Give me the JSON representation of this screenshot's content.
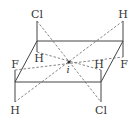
{
  "diagram": {
    "title": "",
    "center_label": "i",
    "atoms": [
      {
        "id": "cl_top",
        "label": "Cl",
        "x": 37,
        "y": 17
      },
      {
        "id": "h_top_right",
        "label": "H",
        "x": 123,
        "y": 17
      },
      {
        "id": "h_inner_left",
        "label": "H",
        "x": 38,
        "y": 60
      },
      {
        "id": "f_right",
        "label": "F",
        "x": 124,
        "y": 66
      },
      {
        "id": "f_left",
        "label": "F",
        "x": 15,
        "y": 66
      },
      {
        "id": "h_inner_right",
        "label": "H",
        "x": 100,
        "y": 66
      },
      {
        "id": "h_bottom_left",
        "label": "H",
        "x": 15,
        "y": 113
      },
      {
        "id": "cl_bottom",
        "label": "Cl",
        "x": 101,
        "y": 113
      }
    ]
  }
}
